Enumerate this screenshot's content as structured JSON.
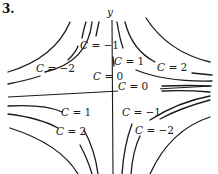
{
  "problem_number": "3.",
  "axes": {
    "y_label": "y",
    "x_label": ""
  },
  "level_curves": {
    "function_form": "C = xy (hyperbolic level curves)",
    "labels": [
      {
        "quadrant": "upper-left",
        "text_var": "C",
        "text_eq": " = ",
        "value": "−1"
      },
      {
        "quadrant": "upper-left",
        "text_var": "C",
        "text_eq": " = ",
        "value": "−2"
      },
      {
        "quadrant": "upper-right",
        "text_var": "C",
        "text_eq": " = ",
        "value": "1"
      },
      {
        "quadrant": "upper-right",
        "text_var": "C",
        "text_eq": " = ",
        "value": "2"
      },
      {
        "quadrant": "axis",
        "text_var": "C",
        "text_eq": " = ",
        "value": "0"
      },
      {
        "quadrant": "axis",
        "text_var": "C",
        "text_eq": " = ",
        "value": "0"
      },
      {
        "quadrant": "lower-left",
        "text_var": "C",
        "text_eq": " = ",
        "value": "1"
      },
      {
        "quadrant": "lower-left",
        "text_var": "C",
        "text_eq": " = ",
        "value": "2"
      },
      {
        "quadrant": "lower-right",
        "text_var": "C",
        "text_eq": " = ",
        "value": "−1"
      },
      {
        "quadrant": "lower-right",
        "text_var": "C",
        "text_eq": " = ",
        "value": "−2"
      }
    ]
  }
}
